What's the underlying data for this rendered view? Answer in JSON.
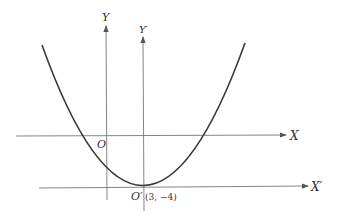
{
  "diagram": {
    "labels": {
      "y_axis": "Y",
      "y_prime_axis": "Y′",
      "x_axis": "X",
      "x_prime_axis": "X′",
      "origin": "O",
      "new_origin": "O′",
      "vertex_coords": "(3, −4)"
    },
    "curve": {
      "type": "parabola",
      "vertex": [
        3,
        -4
      ],
      "opens": "up"
    },
    "colors": {
      "stroke": "#3a3a3a",
      "axis": "#555555",
      "text": "#333333"
    }
  }
}
